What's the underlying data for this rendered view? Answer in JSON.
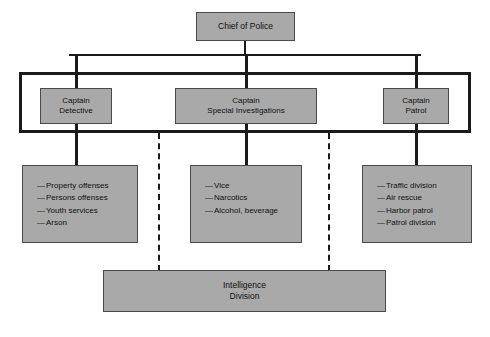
{
  "diagram": {
    "type": "organizational-chart",
    "colors": {
      "box_fill": "#a9a9a9",
      "box_border": "#4a4a4a",
      "line": "#1a1a1a",
      "background": "#ffffff",
      "text": "#101010"
    },
    "chief": {
      "label": "Chief of Police"
    },
    "captains": [
      {
        "id": "detective",
        "label": "Captain\nDetective",
        "rank": "Captain",
        "unit": "Detective"
      },
      {
        "id": "special-investigations",
        "label": "Captain\nSpecial Investigations",
        "rank": "Captain",
        "unit": "Special Investigations"
      },
      {
        "id": "patrol",
        "label": "Captain\nPatrol",
        "rank": "Captain",
        "unit": "Patrol"
      }
    ],
    "detail_lists": [
      {
        "id": "detective-functions",
        "parent": "detective",
        "items": [
          "Property offenses",
          "Persons offenses",
          "Youth services",
          "Arson"
        ]
      },
      {
        "id": "special-investigations-functions",
        "parent": "special-investigations",
        "items": [
          "Vice",
          "Narcotics",
          "Alcohol, beverage"
        ]
      },
      {
        "id": "patrol-functions",
        "parent": "patrol",
        "items": [
          "Traffic division",
          "Air rescue",
          "Harbor patrol",
          "Patrol division"
        ]
      }
    ],
    "staff_unit": {
      "id": "intelligence-division",
      "label": "Intelligence\nDivision"
    },
    "connectors": {
      "solid_note": "solid lines denote direct line authority",
      "dashed_note": "dashed lines denote coordination with Intelligence Division"
    }
  }
}
